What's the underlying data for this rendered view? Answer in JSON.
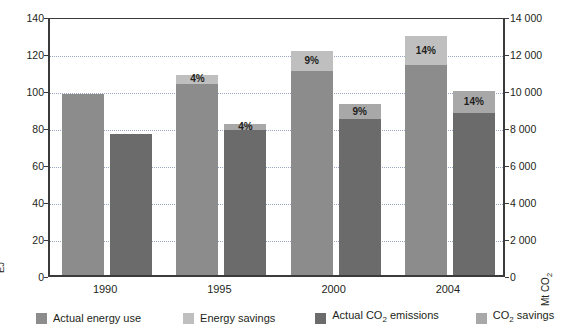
{
  "chart_data": {
    "type": "bar",
    "title": "",
    "subtitle": "",
    "categories": [
      "1990",
      "1995",
      "2000",
      "2004"
    ],
    "xlabel": "",
    "grid": true,
    "legend_position": "bottom",
    "axes": {
      "left": {
        "label": "EJ",
        "label_html": "EJ",
        "min": 0,
        "max": 140,
        "step": 20,
        "ticks": [
          "0",
          "20",
          "40",
          "60",
          "80",
          "100",
          "120",
          "140"
        ]
      },
      "right": {
        "label": "Mt CO2",
        "label_html": "Mt CO<sub>2</sub>",
        "min": 0,
        "max": 14000,
        "step": 2000,
        "ticks": [
          "0",
          "2 000",
          "4 000",
          "6 000",
          "8 000",
          "10 000",
          "12 000",
          "14 000"
        ]
      }
    },
    "series": [
      {
        "name": "Actual energy use",
        "key": "actual_energy_use",
        "axis": "left",
        "color": "#8c8c8c",
        "values": [
          98,
          103.5,
          110.5,
          113.5
        ]
      },
      {
        "name": "Energy savings",
        "key": "energy_savings",
        "axis": "left",
        "color": "#bfbfbf",
        "values": [
          0,
          4.5,
          10.5,
          15.5
        ],
        "stacked_on": "actual_energy_use",
        "data_labels": [
          "",
          "4%",
          "9%",
          "14%"
        ]
      },
      {
        "name": "Actual CO2 emissions",
        "key": "actual_co2_emissions",
        "name_html": "Actual CO<sub>2</sub> emissions",
        "axis": "right",
        "color": "#6b6b6b",
        "values": [
          7600,
          7850,
          8450,
          8750
        ]
      },
      {
        "name": "CO2 savings",
        "key": "co2_savings",
        "name_html": "CO<sub>2</sub> savings",
        "axis": "right",
        "color": "#a8a8a8",
        "values": [
          0,
          320,
          770,
          1200
        ],
        "stacked_on": "actual_co2_emissions",
        "data_labels": [
          "",
          "4%",
          "9%",
          "14%"
        ]
      }
    ],
    "bars": [
      {
        "category": "1990",
        "energy": {
          "actual": 98,
          "savings": 0,
          "savings_label": "",
          "total": 98
        },
        "co2": {
          "actual": 7600,
          "savings": 0,
          "savings_label": "",
          "total": 7600
        }
      },
      {
        "category": "1995",
        "energy": {
          "actual": 103.5,
          "savings": 4.5,
          "savings_label": "4%",
          "total": 108
        },
        "co2": {
          "actual": 7850,
          "savings": 320,
          "savings_label": "4%",
          "total": 8170
        }
      },
      {
        "category": "2000",
        "energy": {
          "actual": 110.5,
          "savings": 10.5,
          "savings_label": "9%",
          "total": 121
        },
        "co2": {
          "actual": 8450,
          "savings": 770,
          "savings_label": "9%",
          "total": 9220
        }
      },
      {
        "category": "2004",
        "energy": {
          "actual": 113.5,
          "savings": 15.5,
          "savings_label": "14%",
          "total": 129
        },
        "co2": {
          "actual": 8750,
          "savings": 1200,
          "savings_label": "14%",
          "total": 9950
        }
      }
    ]
  },
  "legend": {
    "items": [
      {
        "label": "Actual energy use",
        "color": "#8c8c8c"
      },
      {
        "label": "Energy savings",
        "color": "#bfbfbf"
      },
      {
        "label_pre": "Actual CO",
        "label_sub": "2",
        "label_post": " emissions",
        "color": "#6b6b6b"
      },
      {
        "label_pre": "CO",
        "label_sub": "2",
        "label_post": " savings",
        "color": "#a8a8a8"
      }
    ]
  },
  "colors": {
    "actual_energy_use": "#8c8c8c",
    "energy_savings": "#bfbfbf",
    "actual_co2_emissions": "#6b6b6b",
    "co2_savings": "#a8a8a8",
    "axis": "#3b3b3b",
    "gridline": "#9aa7c4",
    "text": "#231f20",
    "background": "#ffffff"
  }
}
